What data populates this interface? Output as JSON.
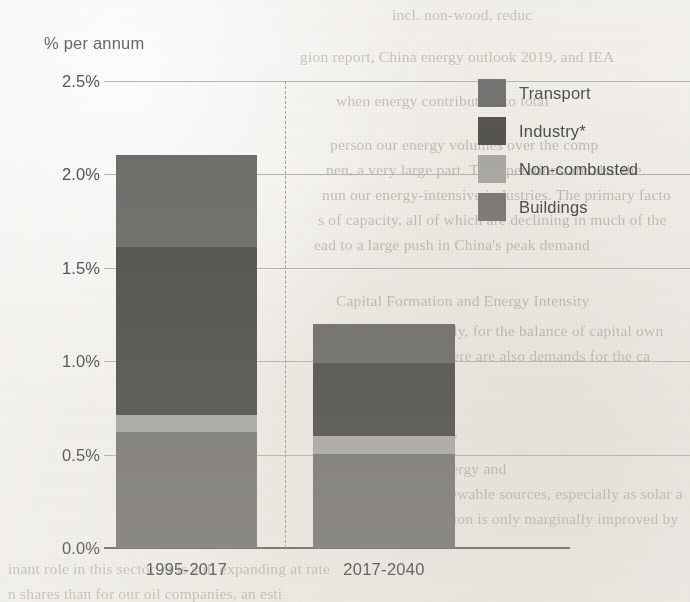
{
  "chart_data": {
    "type": "bar",
    "subtype": "stacked-bar",
    "title": "",
    "axis_title": "% per annum",
    "xlabel": "",
    "ylabel": "% per annum",
    "categories": [
      "1995-2017",
      "2017-2040"
    ],
    "ylim": [
      0.0,
      2.5
    ],
    "ytick_labels": [
      "0.0%",
      "0.5%",
      "1.0%",
      "1.5%",
      "2.0%",
      "2.5%"
    ],
    "ytick_values": [
      0.0,
      0.5,
      1.0,
      1.5,
      2.0,
      2.5
    ],
    "grid": true,
    "legend_position": "right",
    "series": [
      {
        "name": "Transport",
        "color": "#6f6e6b",
        "values": [
          0.49,
          0.21
        ]
      },
      {
        "name": "Industry*",
        "color": "#53524f",
        "values": [
          0.9,
          0.39
        ]
      },
      {
        "name": "Non-combusted",
        "color": "#a9a7a2",
        "values": [
          0.09,
          0.1
        ]
      },
      {
        "name": "Buildings",
        "color": "#7b7975",
        "values": [
          0.62,
          0.5
        ]
      }
    ],
    "totals": [
      2.1,
      1.2
    ],
    "stack_order_bottom_to_top": [
      "Buildings",
      "Non-combusted",
      "Industry*",
      "Transport"
    ],
    "divider_between_categories": true,
    "divider_style": "dashed"
  },
  "legend": {
    "items": [
      {
        "label": "Transport",
        "color": "#6f6e6b"
      },
      {
        "label": "Industry*",
        "color": "#53524f"
      },
      {
        "label": "Non-combusted",
        "color": "#a9a7a2"
      },
      {
        "label": "Buildings",
        "color": "#7b7975"
      }
    ]
  },
  "page_background_text": {
    "lines": [
      {
        "text": "incl. non-wood, reduc",
        "x": 392,
        "y": 2
      },
      {
        "text": "gion report, China energy outlook 2019, and IEA",
        "x": 300,
        "y": 44
      },
      {
        "text": "when energy contribution to total",
        "x": 336,
        "y": 88
      },
      {
        "text": "person our energy volumes over the comp",
        "x": 330,
        "y": 132
      },
      {
        "text": "nen, a very large part. The operations are also the",
        "x": 326,
        "y": 157
      },
      {
        "text": "nun our energy-intensive industries. The primary facto",
        "x": 322,
        "y": 182
      },
      {
        "text": "s of capacity, all of which are declining in much of the",
        "x": 318,
        "y": 207
      },
      {
        "text": "ead to a large push in China's peak demand",
        "x": 314,
        "y": 232
      },
      {
        "text": "Capital Formation and Energy Intensity",
        "x": 336,
        "y": 288
      },
      {
        "text": "tage level very rapidly, for the balance of capital own",
        "x": 322,
        "y": 318
      },
      {
        "text": "he base economy. There are also demands for the ca",
        "x": 318,
        "y": 343
      },
      {
        "text": "Alternative Energy",
        "x": 336,
        "y": 424
      },
      {
        "text": "e part of our own energy and",
        "x": 322,
        "y": 456
      },
      {
        "text": "n of energy from renewable sources, especially as solar a",
        "x": 318,
        "y": 481
      },
      {
        "text": "nd in the global equation is only marginally improved by",
        "x": 314,
        "y": 506
      },
      {
        "text": "inant role in this sector: it is still expanding at rate",
        "x": 8,
        "y": 556
      },
      {
        "text": "n shares than for our oil companies, an esti",
        "x": 8,
        "y": 581
      }
    ]
  }
}
